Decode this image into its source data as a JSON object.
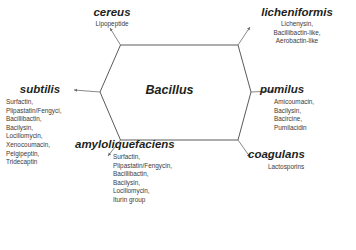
{
  "figure": {
    "center": {
      "label": "Bacillus"
    },
    "style": {
      "hexagon_stroke": "#5a5a5a",
      "connector_stroke": "#6b6b6b",
      "title_color": "#231f20",
      "list_color": "#3b3b3b",
      "background": "#ffffff"
    },
    "nodes": [
      {
        "id": "cereus",
        "title": "cereus",
        "compounds": [
          "Lipopeptide"
        ]
      },
      {
        "id": "licheniformis",
        "title": "licheniformis",
        "compounds": [
          "Lichenysin,",
          "Bacillibactin-like,",
          "Aerobactin-like"
        ]
      },
      {
        "id": "subtilis",
        "title": "subtilis",
        "compounds": [
          "Surfactin,",
          "Plipastatin/Fengyci,",
          "Bacillibactin,",
          "Bacilysin,",
          "Locillomycin,",
          "Xenocoumacin,",
          "Pelgipeptin,",
          "Tridecaptin"
        ]
      },
      {
        "id": "pumilus",
        "title": "pumilus",
        "compounds": [
          "Amicoumacin,",
          "Bacilysin,",
          "Bacircine,",
          "Pumilacidin"
        ]
      },
      {
        "id": "amyloliquefaciens",
        "title": "amyloliquefaciens",
        "compounds": [
          "Surfactin,",
          "Plipastatin/Fengycin,",
          "Bacillibactin,",
          "Bacilysin,",
          "Locillomycin,",
          "Iturin group"
        ]
      },
      {
        "id": "coagulans",
        "title": "coagulans",
        "compounds": [
          "Lactosporins"
        ]
      }
    ]
  }
}
